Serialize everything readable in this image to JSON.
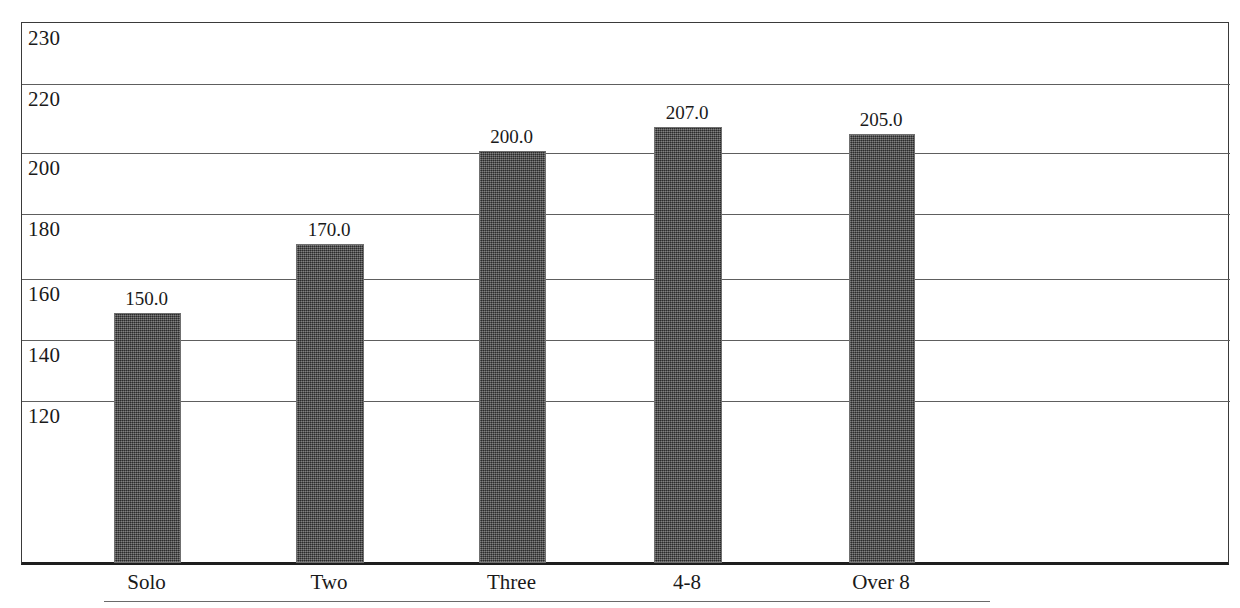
{
  "chart_data": {
    "type": "bar",
    "title": "",
    "subtitle": "",
    "xlabel": "",
    "ylabel": "",
    "categories": [
      "Solo",
      "Two",
      "Three",
      "4-8",
      "Over 8"
    ],
    "values": [
      150.0,
      170.0,
      200.0,
      207.0,
      205.0
    ],
    "value_labels": [
      "150.0",
      "170.0",
      "200.0",
      "207.0",
      "205.0"
    ],
    "series": [
      {
        "name": "",
        "values": [
          150.0,
          170.0,
          200.0,
          207.0,
          205.0
        ]
      }
    ],
    "ylim": [
      88,
      230
    ],
    "ytick_labels": [
      "230",
      "220",
      "200",
      "180",
      "160",
      "140",
      "120"
    ],
    "ytick_values": [
      230,
      220,
      200,
      180,
      160,
      140,
      120
    ],
    "grid": true,
    "grid_axis": "y",
    "legend": "none",
    "bar_color": "#474747",
    "bar_fill": "checkered-dither",
    "frame_color": "#3a3a3a",
    "axis_color": "#1e1e1e",
    "background": "#ffffff",
    "annotations": []
  },
  "layout": {
    "plot": {
      "left": 21,
      "top": 22,
      "width": 1208,
      "height": 543
    },
    "gridlines_y_px": [
      22,
      83,
      152,
      213,
      278,
      339,
      400
    ],
    "baseline_y_px": 562,
    "bars_px": [
      {
        "left": 113,
        "width": 67,
        "top": 312
      },
      {
        "left": 295,
        "width": 68,
        "top": 243
      },
      {
        "left": 478,
        "width": 67,
        "top": 150
      },
      {
        "left": 653,
        "width": 68,
        "top": 126
      },
      {
        "left": 848,
        "width": 66,
        "top": 133
      }
    ],
    "value_label_y_px": [
      289,
      220,
      127,
      103,
      110
    ],
    "category_label_y_px": 572
  }
}
